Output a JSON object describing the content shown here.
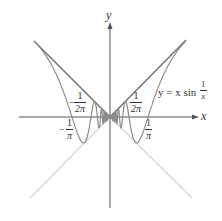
{
  "figure": {
    "axes": {
      "x_label": "x",
      "y_label": "y"
    },
    "function_label": {
      "prefix": "y = x sin",
      "frac_num": "1",
      "frac_den": "x"
    },
    "tick_labels": {
      "neg_1_over_2pi": {
        "sign": "−",
        "num": "1",
        "den": "2π"
      },
      "pos_1_over_2pi": {
        "num": "1",
        "den": "2π"
      },
      "neg_1_over_pi": {
        "sign": "−",
        "num": "1",
        "den": "π"
      },
      "pos_1_over_pi": {
        "num": "1",
        "den": "π"
      }
    },
    "colors": {
      "curve": "#8a8a8a",
      "envelope_upper": "#6e6e6e",
      "envelope_lower": "#d4d4d4",
      "axis": "#555555"
    }
  },
  "chart_data": {
    "type": "line",
    "xlabel": "x",
    "ylabel": "y",
    "series": [
      {
        "name": "y = x sin(1/x)",
        "formula": "x*sin(1/x)"
      },
      {
        "name": "y = |x| (upper envelope)",
        "formula": "|x|"
      },
      {
        "name": "y = -|x| (lower envelope)",
        "formula": "-|x|"
      }
    ],
    "annotations": [
      "-1/(2π)",
      "1/(2π)",
      "-1/π",
      "1/π"
    ],
    "grid": false
  }
}
